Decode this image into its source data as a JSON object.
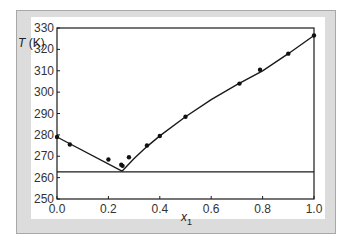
{
  "chart_data": {
    "type": "scatter",
    "title": "",
    "xlabel": "x1",
    "xlabel_main": "x",
    "xlabel_sub": "1",
    "ylabel": "T (K)",
    "ylabel_var": "T",
    "ylabel_unit": " (K)",
    "xlim": [
      0.0,
      1.0
    ],
    "ylim": [
      250,
      330
    ],
    "xticks": [
      "0.0",
      "0.2",
      "0.4",
      "0.6",
      "0.8",
      "1.0"
    ],
    "xtick_values": [
      0.0,
      0.2,
      0.4,
      0.6,
      0.8,
      1.0
    ],
    "yticks": [
      "250",
      "260",
      "270",
      "280",
      "290",
      "300",
      "310",
      "320",
      "330"
    ],
    "ytick_values": [
      250,
      260,
      270,
      280,
      290,
      300,
      310,
      320,
      330
    ],
    "grid": false,
    "legend": null,
    "series": [
      {
        "name": "experimental",
        "type": "scatter",
        "x": [
          0.0,
          0.05,
          0.2,
          0.25,
          0.255,
          0.28,
          0.35,
          0.4,
          0.5,
          0.71,
          0.79,
          0.9,
          1.0
        ],
        "y": [
          279.0,
          275.5,
          268.5,
          266.0,
          265.5,
          269.5,
          275.0,
          279.5,
          288.5,
          304.0,
          310.5,
          318.0,
          326.5
        ]
      },
      {
        "name": "liquidus-left",
        "type": "line",
        "x": [
          0.0,
          0.253
        ],
        "y": [
          279.0,
          263.0
        ]
      },
      {
        "name": "liquidus-right",
        "type": "line",
        "x": [
          0.253,
          0.3,
          0.35,
          0.4,
          0.5,
          0.6,
          0.7,
          0.8,
          0.9,
          1.0
        ],
        "y": [
          263.0,
          269.0,
          274.5,
          279.5,
          288.5,
          296.5,
          303.5,
          310.0,
          318.0,
          326.5
        ]
      },
      {
        "name": "eutectic-line",
        "type": "line",
        "x": [
          0.0,
          1.0
        ],
        "y": [
          262.7,
          262.7
        ]
      }
    ],
    "colors": {
      "line": "#1a1a1a",
      "marker": "#111111",
      "panel_border": "#dcdcdc"
    }
  }
}
